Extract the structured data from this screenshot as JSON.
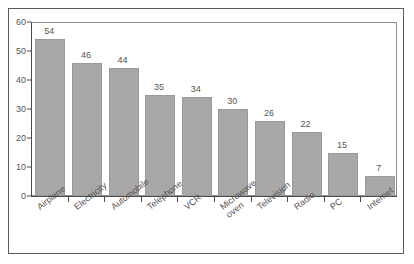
{
  "chart_data": {
    "type": "bar",
    "title": "",
    "subtitle": "",
    "xlabel": "",
    "ylabel": "",
    "ylim": [
      0,
      60
    ],
    "yticks": [
      0,
      10,
      20,
      30,
      40,
      50,
      60
    ],
    "grid": false,
    "legend": null,
    "bar_color": "#a8a8a8",
    "categories": [
      "Airplane",
      "Electricity",
      "Automobile",
      "Telephone",
      "VCR",
      "Microwave oven",
      "Television",
      "Radio",
      "PC",
      "Internet"
    ],
    "category_lines": [
      [
        "Airplane"
      ],
      [
        "Electricity"
      ],
      [
        "Automobile"
      ],
      [
        "Telephone"
      ],
      [
        "VCR"
      ],
      [
        "Microwave",
        "oven"
      ],
      [
        "Television"
      ],
      [
        "Radio"
      ],
      [
        "PC"
      ],
      [
        "Internet"
      ]
    ],
    "values": [
      54,
      46,
      44,
      35,
      34,
      30,
      26,
      22,
      15,
      7
    ],
    "value_labels": [
      "54",
      "46",
      "44",
      "35",
      "34",
      "30",
      "26",
      "22",
      "15",
      "7"
    ]
  }
}
